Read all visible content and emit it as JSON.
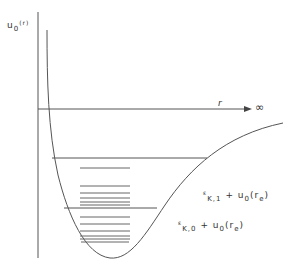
{
  "diagram": {
    "y_axis_label": {
      "main": "u",
      "sub": "0",
      "arg": "(r)"
    },
    "x_axis_label": "r",
    "x_axis_end": "∞",
    "level_label_1": {
      "eps": "ε",
      "sub": "K,1",
      "rest": " + u",
      "sub2": "0",
      "arg": "(r",
      "sub3": "e",
      "close": ")"
    },
    "level_label_0": {
      "eps": "ε",
      "sub": "K,0",
      "rest": " + u",
      "sub2": "0",
      "arg": "(r",
      "sub3": "e",
      "close": ")"
    },
    "colors": {
      "line": "#555555",
      "text": "#333333",
      "background": "#ffffff"
    },
    "upper_group_levels_y": [
      168,
      186,
      193,
      198,
      202,
      205
    ],
    "lower_group_levels_y": [
      217,
      224,
      231,
      236,
      239,
      242
    ],
    "long_levels_y": [
      158,
      208
    ]
  }
}
